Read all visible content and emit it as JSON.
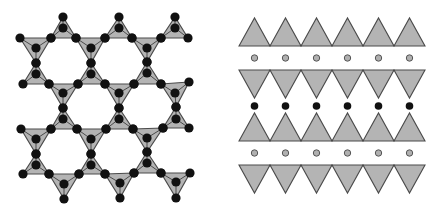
{
  "figure": {
    "colors": {
      "background": "#ffffff",
      "tetra_fill": "#b4b4b4",
      "tetra_stroke": "#4a4a4a",
      "atom_black": "#111111",
      "atom_gray_fill": "#b0b0b0",
      "atom_gray_stroke": "#555555"
    },
    "left_panel": {
      "name": "top-view-kagome-sheet",
      "atom_radius": 4.6,
      "tetrahedra": [
        {
          "v": [
            [
              63,
              17
            ],
            [
              51,
              38
            ],
            [
              76,
              38
            ]
          ],
          "c": [
            63,
            28
          ]
        },
        {
          "v": [
            [
              119,
              17
            ],
            [
              105,
              38
            ],
            [
              132,
              38
            ]
          ],
          "c": [
            119,
            28
          ]
        },
        {
          "v": [
            [
              175,
              17
            ],
            [
              161,
              38
            ],
            [
              188,
              38
            ]
          ],
          "c": [
            175,
            28
          ]
        },
        {
          "v": [
            [
              20,
              38
            ],
            [
              51,
              38
            ],
            [
              36,
              63
            ]
          ],
          "c": [
            36,
            48
          ]
        },
        {
          "v": [
            [
              36,
              63
            ],
            [
              23,
              84
            ],
            [
              49,
              84
            ]
          ],
          "c": [
            36,
            74
          ]
        },
        {
          "v": [
            [
              76,
              38
            ],
            [
              105,
              38
            ],
            [
              91,
              63
            ]
          ],
          "c": [
            91,
            48
          ]
        },
        {
          "v": [
            [
              91,
              63
            ],
            [
              78,
              84
            ],
            [
              105,
              84
            ]
          ],
          "c": [
            91,
            74
          ]
        },
        {
          "v": [
            [
              132,
              38
            ],
            [
              161,
              38
            ],
            [
              147,
              62
            ]
          ],
          "c": [
            147,
            48
          ]
        },
        {
          "v": [
            [
              147,
              62
            ],
            [
              134,
              84
            ],
            [
              161,
              84
            ]
          ],
          "c": [
            147,
            73
          ]
        },
        {
          "v": [
            [
              49,
              84
            ],
            [
              78,
              84
            ],
            [
              63,
              108
            ]
          ],
          "c": [
            63,
            93
          ]
        },
        {
          "v": [
            [
              63,
              108
            ],
            [
              51,
              129
            ],
            [
              77,
              129
            ]
          ],
          "c": [
            63,
            119
          ]
        },
        {
          "v": [
            [
              105,
              84
            ],
            [
              134,
              84
            ],
            [
              119,
              108
            ]
          ],
          "c": [
            119,
            93
          ]
        },
        {
          "v": [
            [
              119,
              108
            ],
            [
              106,
              129
            ],
            [
              133,
              129
            ]
          ],
          "c": [
            119,
            119
          ]
        },
        {
          "v": [
            [
              161,
              84
            ],
            [
              189,
              82
            ],
            [
              176,
              107
            ]
          ],
          "c": [
            175,
            93
          ]
        },
        {
          "v": [
            [
              176,
              107
            ],
            [
              163,
              128
            ],
            [
              189,
              128
            ]
          ],
          "c": [
            176,
            119
          ]
        },
        {
          "v": [
            [
              21,
              129
            ],
            [
              51,
              129
            ],
            [
              36,
              154
            ]
          ],
          "c": [
            36,
            139
          ]
        },
        {
          "v": [
            [
              36,
              154
            ],
            [
              23,
              174
            ],
            [
              49,
              174
            ]
          ],
          "c": [
            36,
            165
          ]
        },
        {
          "v": [
            [
              77,
              129
            ],
            [
              106,
              129
            ],
            [
              91,
              154
            ]
          ],
          "c": [
            91,
            139
          ]
        },
        {
          "v": [
            [
              91,
              154
            ],
            [
              79,
              174
            ],
            [
              105,
              174
            ]
          ],
          "c": [
            91,
            165
          ]
        },
        {
          "v": [
            [
              133,
              129
            ],
            [
              163,
              128
            ],
            [
              147,
              152
            ]
          ],
          "c": [
            147,
            138
          ]
        },
        {
          "v": [
            [
              147,
              152
            ],
            [
              134,
              173
            ],
            [
              161,
              173
            ]
          ],
          "c": [
            147,
            163
          ]
        },
        {
          "v": [
            [
              49,
              174
            ],
            [
              79,
              174
            ],
            [
              64,
              199
            ]
          ],
          "c": [
            64,
            184
          ]
        },
        {
          "v": [
            [
              105,
              174
            ],
            [
              134,
              173
            ],
            [
              120,
              198
            ]
          ],
          "c": [
            120,
            183
          ]
        },
        {
          "v": [
            [
              161,
              173
            ],
            [
              190,
              173
            ],
            [
              176,
              198
            ]
          ],
          "c": [
            176,
            182
          ]
        }
      ]
    },
    "right_panel": {
      "name": "side-view-layer-stacking",
      "x_start": 239,
      "tri_width": 31,
      "count": 6,
      "rows": [
        {
          "kind": "tri-up",
          "y_top": 18,
          "y_bottom": 46
        },
        {
          "kind": "dot-gray",
          "y": 58
        },
        {
          "kind": "tri-down",
          "y_top": 70,
          "y_bottom": 98
        },
        {
          "kind": "dot-black",
          "y": 106
        },
        {
          "kind": "tri-up",
          "y_top": 113,
          "y_bottom": 141
        },
        {
          "kind": "dot-gray",
          "y": 153
        },
        {
          "kind": "tri-down",
          "y_top": 165,
          "y_bottom": 193
        }
      ],
      "dot_radius": 3.2,
      "legend": {
        "tri-up": "tetrahedral sheet (apex up)",
        "tri-down": "tetrahedral sheet (apex down)",
        "dot-gray": "interlayer cation (gray)",
        "dot-black": "interlayer cation (black)"
      }
    }
  }
}
